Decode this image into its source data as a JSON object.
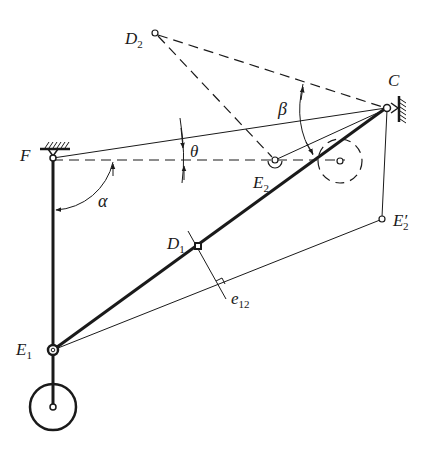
{
  "diagram": {
    "type": "linkage-mechanism",
    "colors": {
      "stroke": "#1a1a1a",
      "background": "#ffffff"
    },
    "points": {
      "C": {
        "label": "C",
        "sub": "",
        "x": 387,
        "y": 108
      },
      "F": {
        "label": "F",
        "sub": "",
        "x": 53,
        "y": 158
      },
      "E1": {
        "label": "E",
        "sub": "1",
        "x": 53,
        "y": 350
      },
      "E2": {
        "label": "E",
        "sub": "2",
        "x": 275,
        "y": 161
      },
      "E2p": {
        "label": "E′",
        "sub": "2",
        "x": 382,
        "y": 219
      },
      "D1": {
        "label": "D",
        "sub": "1",
        "x": 198,
        "y": 246
      },
      "D2": {
        "label": "D",
        "sub": "2",
        "x": 155,
        "y": 33
      }
    },
    "angles": {
      "alpha": "α",
      "beta": "β",
      "theta": "θ"
    },
    "annotations": {
      "e12": {
        "label": "e",
        "sub": "12"
      }
    }
  }
}
